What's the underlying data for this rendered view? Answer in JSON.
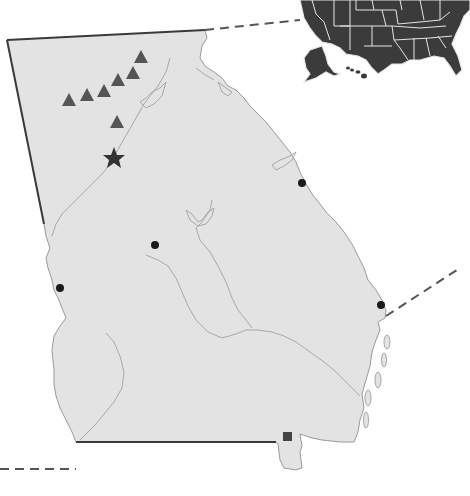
{
  "map": {
    "subject": "Georgia (US state) locator map",
    "inset": "United States locator (contiguous US, Alaska, Hawaii)",
    "colors": {
      "state_fill": "#e3e3e3",
      "inset_fill": "#3b3b3b",
      "marker_triangle": "#555555",
      "marker_star": "#333333",
      "marker_dot": "#1a1a1a",
      "marker_square": "#444444"
    },
    "markers": {
      "triangles": [
        {
          "x": 69,
          "y": 100
        },
        {
          "x": 87,
          "y": 95
        },
        {
          "x": 104,
          "y": 91
        },
        {
          "x": 118,
          "y": 80
        },
        {
          "x": 133,
          "y": 73
        },
        {
          "x": 141,
          "y": 58
        },
        {
          "x": 117,
          "y": 122
        }
      ],
      "stars": [
        {
          "x": 114,
          "y": 158
        }
      ],
      "dots": [
        {
          "x": 302,
          "y": 183
        },
        {
          "x": 155,
          "y": 245
        },
        {
          "x": 60,
          "y": 288
        },
        {
          "x": 381,
          "y": 305
        }
      ],
      "squares": [
        {
          "x": 288,
          "y": 437
        }
      ]
    },
    "text_labels": []
  }
}
